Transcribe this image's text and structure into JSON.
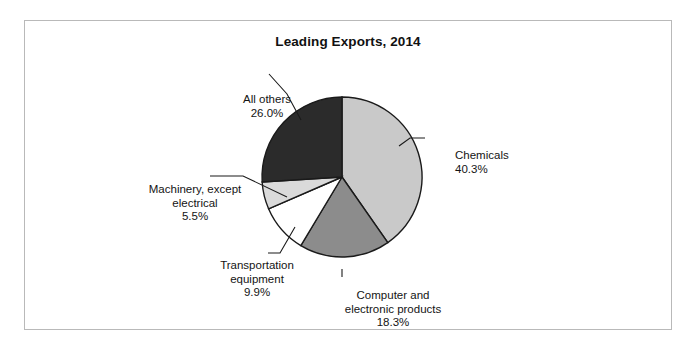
{
  "chart_data": {
    "type": "pie",
    "title": "Leading Exports, 2014",
    "xlabel": "",
    "ylabel": "",
    "legend_position": "none",
    "grid": false,
    "labels_outside": true,
    "categories": [
      "Chemicals",
      "Computer and electronic products",
      "Transportation equipment",
      "Machinery, except electrical",
      "All others"
    ],
    "values": [
      40.3,
      18.3,
      9.9,
      5.5,
      26.0
    ],
    "value_suffix": "%",
    "colors": [
      "#c9c9c9",
      "#8c8c8c",
      "#ffffff",
      "#dadada",
      "#2b2b2b"
    ],
    "slices": [
      {
        "label": "Chemicals",
        "value": 40.3,
        "value_text": "40.3%",
        "color": "#c9c9c9"
      },
      {
        "label": "Computer and electronic products",
        "value": 18.3,
        "value_text": "18.3%",
        "color": "#8c8c8c"
      },
      {
        "label": "Transportation equipment",
        "value": 9.9,
        "value_text": "9.9%",
        "color": "#ffffff"
      },
      {
        "label": "Machinery, except electrical",
        "value": 5.5,
        "value_text": "5.5%",
        "color": "#dadada"
      },
      {
        "label": "All others",
        "value": 26.0,
        "value_text": "26.0%",
        "color": "#2b2b2b"
      }
    ]
  },
  "labels": {
    "all_others": {
      "name": "All others",
      "pct": "26.0%"
    },
    "chemicals": {
      "name": "Chemicals",
      "pct": "40.3%"
    },
    "machinery": {
      "line1": "Machinery, except",
      "line2": "electrical",
      "pct": "5.5%"
    },
    "transportation": {
      "line1": "Transportation",
      "line2": "equipment",
      "pct": "9.9%"
    },
    "computer": {
      "line1": "Computer and",
      "line2": "electronic products",
      "pct": "18.3%"
    }
  },
  "style": {
    "frame_border": "#b9b9b9",
    "slice_outline": "#1a1a1a",
    "leader_line": "#1a1a1a",
    "background": "#ffffff"
  }
}
